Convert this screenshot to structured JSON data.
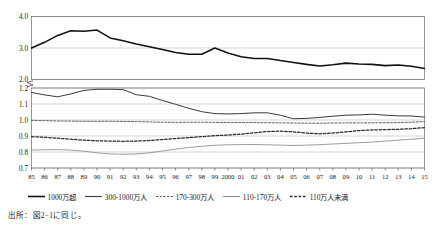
{
  "chart_data": {
    "type": "line",
    "title": "",
    "xlabel": "",
    "ylabel": "",
    "grid": true,
    "legend_position": "bottom",
    "broken_axis": true,
    "upper_panel": {
      "ylim": [
        2.0,
        4.0
      ],
      "yticks": [
        2.0,
        3.0,
        4.0
      ],
      "ytick_labels": [
        "2.0",
        "3.0",
        "4.0"
      ]
    },
    "lower_panel": {
      "ylim": [
        0.7,
        1.2
      ],
      "yticks": [
        0.7,
        0.8,
        0.9,
        1.0,
        1.1,
        1.2
      ],
      "ytick_labels": [
        "0.7",
        "0.8",
        "0.9",
        "1.0",
        "1.1",
        "1.2"
      ]
    },
    "x": [
      1985,
      1986,
      1987,
      1988,
      1989,
      1990,
      1991,
      1992,
      1993,
      1994,
      1995,
      1996,
      1997,
      1998,
      1999,
      2000,
      2001,
      2002,
      2003,
      2004,
      2005,
      2006,
      2007,
      2008,
      2009,
      2010,
      2011,
      2012,
      2013,
      2014,
      2015
    ],
    "categories": [
      "85",
      "86",
      "87",
      "88",
      "89",
      "90",
      "91",
      "92",
      "93",
      "94",
      "95",
      "96",
      "97",
      "98",
      "99",
      "2000",
      "01",
      "02",
      "03",
      "04",
      "05",
      "06",
      "07",
      "08",
      "09",
      "10",
      "11",
      "12",
      "13",
      "14",
      "15"
    ],
    "series": [
      {
        "name": "1000万超",
        "panel": "upper",
        "style": "solid-thick",
        "values": [
          3.0,
          3.18,
          3.4,
          3.55,
          3.53,
          3.57,
          3.32,
          3.23,
          3.13,
          3.04,
          2.95,
          2.86,
          2.8,
          2.8,
          3.0,
          2.84,
          2.72,
          2.67,
          2.67,
          2.6,
          2.54,
          2.48,
          2.43,
          2.47,
          2.52,
          2.49,
          2.48,
          2.44,
          2.46,
          2.42,
          2.35
        ]
      },
      {
        "name": "300-1000万人",
        "panel": "lower",
        "style": "solid",
        "values": [
          1.172,
          1.157,
          1.145,
          1.163,
          1.185,
          1.192,
          1.192,
          1.19,
          1.158,
          1.148,
          1.122,
          1.098,
          1.073,
          1.052,
          1.04,
          1.038,
          1.04,
          1.045,
          1.045,
          1.03,
          1.008,
          1.01,
          1.016,
          1.024,
          1.03,
          1.032,
          1.036,
          1.03,
          1.026,
          1.025,
          1.018
        ]
      },
      {
        "name": "170-300万人",
        "panel": "lower",
        "style": "dashed-fine",
        "values": [
          0.998,
          0.996,
          0.994,
          0.993,
          0.992,
          0.992,
          0.992,
          0.991,
          0.99,
          0.988,
          0.986,
          0.985,
          0.986,
          0.986,
          0.985,
          0.984,
          0.984,
          0.984,
          0.983,
          0.982,
          0.981,
          0.98,
          0.98,
          0.981,
          0.982,
          0.982,
          0.982,
          0.983,
          0.984,
          0.986,
          0.99
        ]
      },
      {
        "name": "110-170万人",
        "panel": "lower",
        "style": "solid-light",
        "values": [
          0.812,
          0.814,
          0.815,
          0.812,
          0.805,
          0.795,
          0.788,
          0.786,
          0.788,
          0.795,
          0.806,
          0.818,
          0.828,
          0.836,
          0.842,
          0.845,
          0.846,
          0.847,
          0.845,
          0.843,
          0.841,
          0.843,
          0.846,
          0.85,
          0.854,
          0.858,
          0.862,
          0.868,
          0.874,
          0.88,
          0.886
        ]
      },
      {
        "name": "110万人未満",
        "panel": "lower",
        "style": "dashed-bold",
        "values": [
          0.896,
          0.892,
          0.886,
          0.88,
          0.874,
          0.87,
          0.868,
          0.867,
          0.868,
          0.872,
          0.878,
          0.884,
          0.89,
          0.896,
          0.902,
          0.906,
          0.912,
          0.92,
          0.928,
          0.93,
          0.926,
          0.918,
          0.914,
          0.918,
          0.926,
          0.934,
          0.938,
          0.94,
          0.942,
          0.946,
          0.952
        ]
      }
    ]
  },
  "legend": {
    "items": [
      {
        "label": "1000万超",
        "style": "solid-thick"
      },
      {
        "label": "300-1000万人",
        "style": "solid"
      },
      {
        "label": "170-300万人",
        "style": "dashed-fine"
      },
      {
        "label": "110-170万人",
        "style": "solid-light"
      },
      {
        "label": "110万人未満",
        "style": "dashed-bold"
      }
    ]
  },
  "source": {
    "text": "出所：図2−1に同じ。"
  }
}
